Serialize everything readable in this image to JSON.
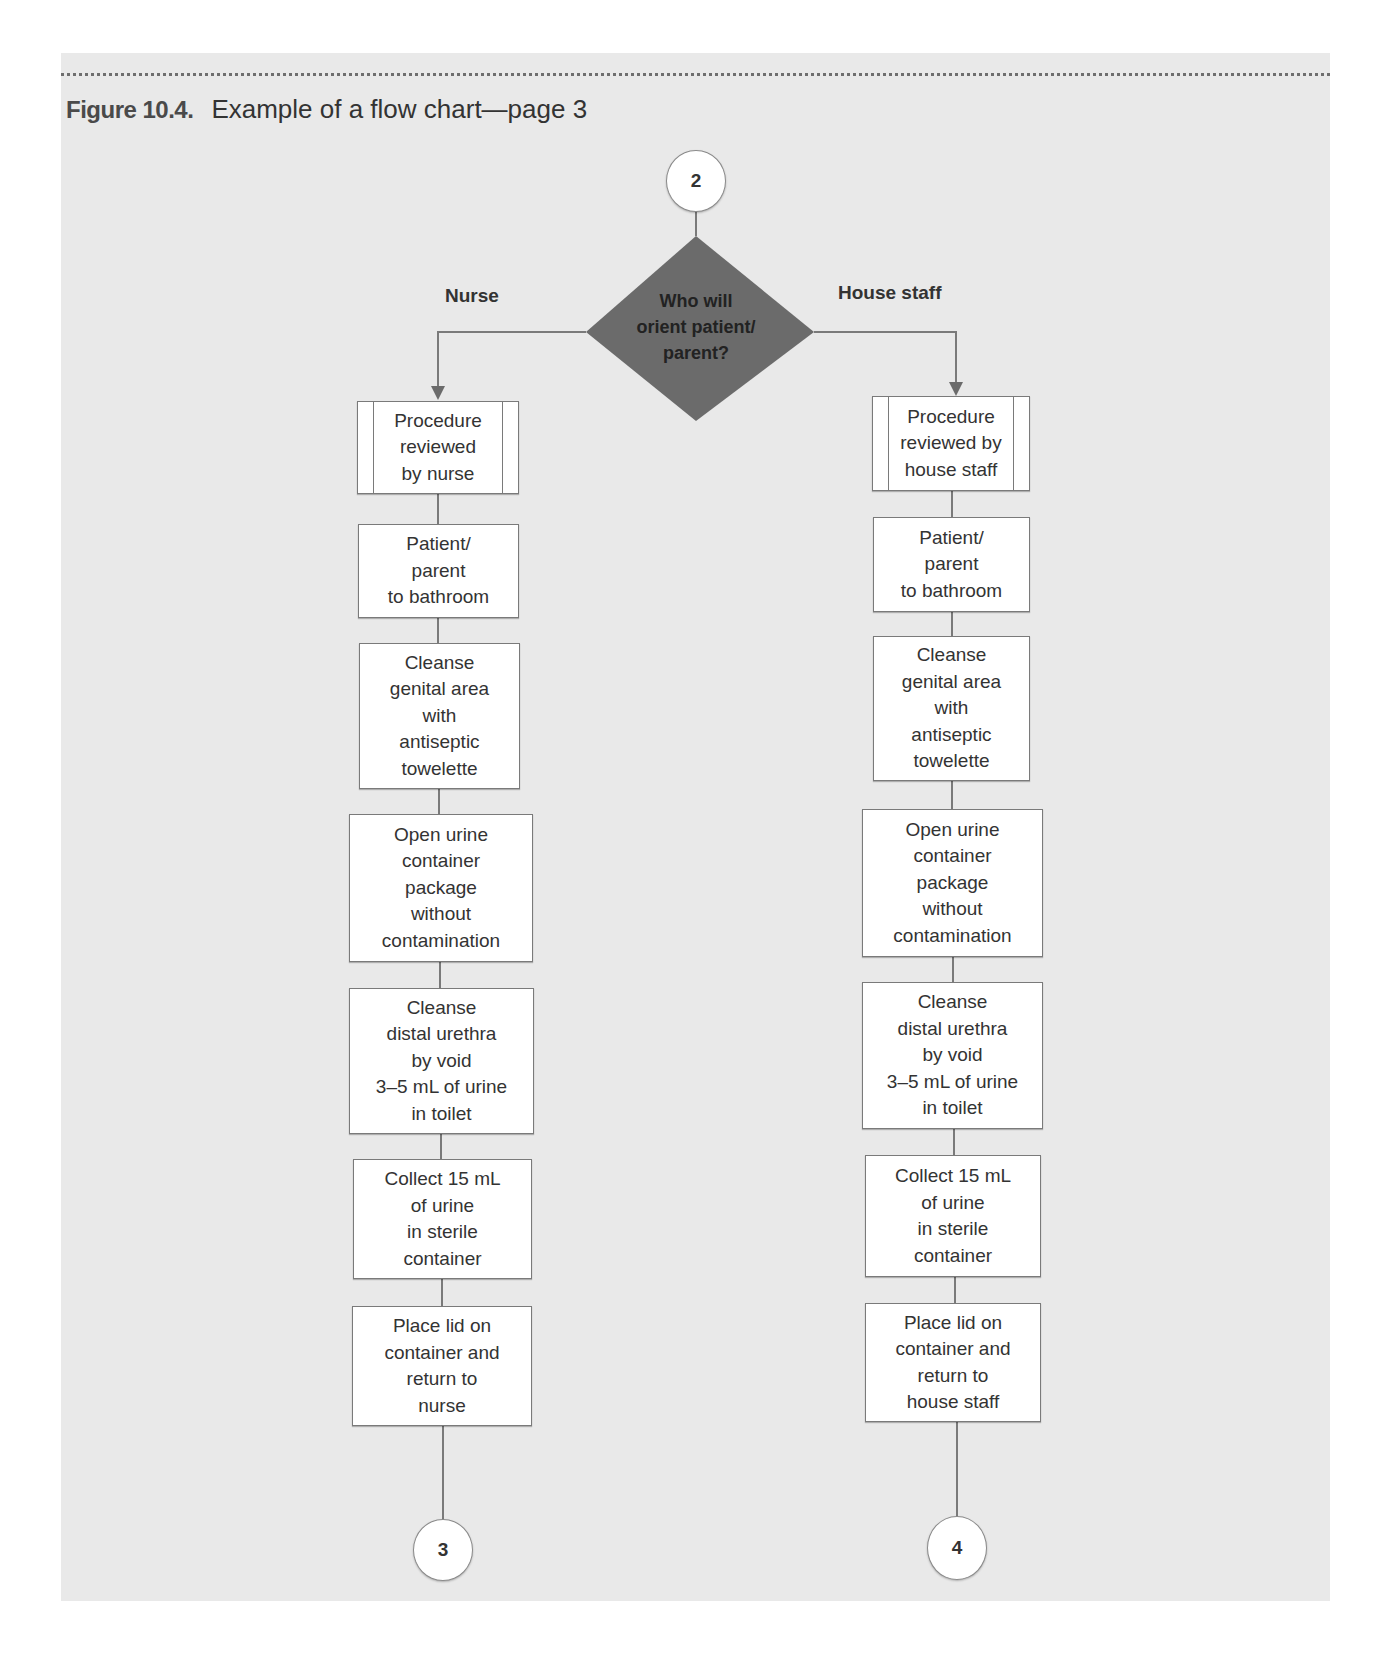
{
  "figure": {
    "number": "Figure 10.4.",
    "title": "Example of a flow chart—page 3"
  },
  "flowchart": {
    "start_connector": "2",
    "decision": "Who will\norient patient/\nparent?",
    "branches": {
      "left_label": "Nurse",
      "right_label": "House staff"
    },
    "nurse_steps": [
      "Procedure\nreviewed\nby nurse",
      "Patient/\nparent\nto bathroom",
      "Cleanse\ngenital area\nwith\nantiseptic\ntowelette",
      "Open urine\ncontainer\npackage\nwithout\ncontamination",
      "Cleanse\ndistal urethra\nby void\n3–5 mL of urine\nin toilet",
      "Collect 15 mL\nof urine\nin sterile\ncontainer",
      "Place lid on\ncontainer and\nreturn to\nnurse"
    ],
    "house_staff_steps": [
      "Procedure\nreviewed by\nhouse staff",
      "Patient/\nparent\nto bathroom",
      "Cleanse\ngenital area\nwith\nantiseptic\ntowelette",
      "Open urine\ncontainer\npackage\nwithout\ncontamination",
      "Cleanse\ndistal urethra\nby void\n3–5 mL of urine\nin toilet",
      "Collect 15 mL\nof urine\nin sterile\ncontainer",
      "Place lid on\ncontainer and\nreturn to\nhouse staff"
    ],
    "end_connectors": {
      "nurse": "3",
      "house_staff": "4"
    },
    "colors": {
      "page_background": "#e9e9e9",
      "decision_fill": "#6b6b6b",
      "box_fill": "#ffffff",
      "line": "#7a7a7a"
    }
  }
}
